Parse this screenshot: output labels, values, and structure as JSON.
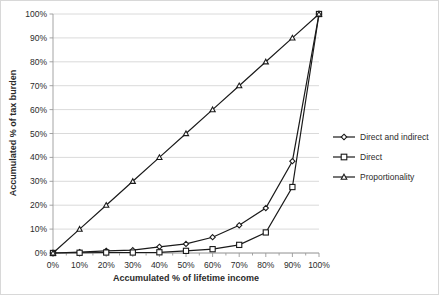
{
  "chart_data": {
    "type": "line",
    "title": "",
    "xlabel": "Accumulated % of lifetime income",
    "ylabel": "Accumulated % of tax burden",
    "x": [
      0,
      10,
      20,
      30,
      40,
      50,
      60,
      70,
      80,
      90,
      100
    ],
    "xticklabels": [
      "0%",
      "10%",
      "20%",
      "30%",
      "40%",
      "50%",
      "60%",
      "70%",
      "80%",
      "90%",
      "100%"
    ],
    "yticklabels": [
      "0%",
      "10%",
      "20%",
      "30%",
      "40%",
      "50%",
      "60%",
      "70%",
      "80%",
      "90%",
      "100%"
    ],
    "xlim": [
      0,
      100
    ],
    "ylim": [
      0,
      100
    ],
    "grid": true,
    "legend_position": "right",
    "series": [
      {
        "name": "Direct and indirect",
        "marker": "diamond",
        "values": [
          0,
          0.4,
          0.9,
          1.2,
          2.6,
          3.8,
          6.6,
          11.6,
          18.8,
          38.4,
          100
        ]
      },
      {
        "name": "Direct",
        "marker": "square",
        "values": [
          0,
          0.1,
          0.2,
          0.2,
          0.3,
          0.9,
          1.6,
          3.4,
          8.6,
          27.6,
          100
        ]
      },
      {
        "name": "Proportionality",
        "marker": "triangle",
        "values": [
          0,
          10,
          20,
          30,
          40,
          50,
          60,
          70,
          80,
          90,
          100
        ]
      }
    ]
  },
  "axes": {
    "x_title": "Accumulated % of lifetime income",
    "y_title": "Accumulated % of tax burden"
  },
  "legend": {
    "items": [
      {
        "label": "Direct and indirect",
        "marker": "diamond-marker"
      },
      {
        "label": "Direct",
        "marker": "square-marker"
      },
      {
        "label": "Proportionality",
        "marker": "triangle-marker"
      }
    ]
  },
  "ticks": {
    "x": [
      "0%",
      "10%",
      "20%",
      "30%",
      "40%",
      "50%",
      "60%",
      "70%",
      "80%",
      "90%",
      "100%"
    ],
    "y": [
      "0%",
      "10%",
      "20%",
      "30%",
      "40%",
      "50%",
      "60%",
      "70%",
      "80%",
      "90%",
      "100%"
    ]
  },
  "colors": {
    "line": "#1a1a1a",
    "grid": "#d0d0d0",
    "axis": "#9a9a9a",
    "text": "#2b2b2b",
    "background": "#ffffff"
  }
}
